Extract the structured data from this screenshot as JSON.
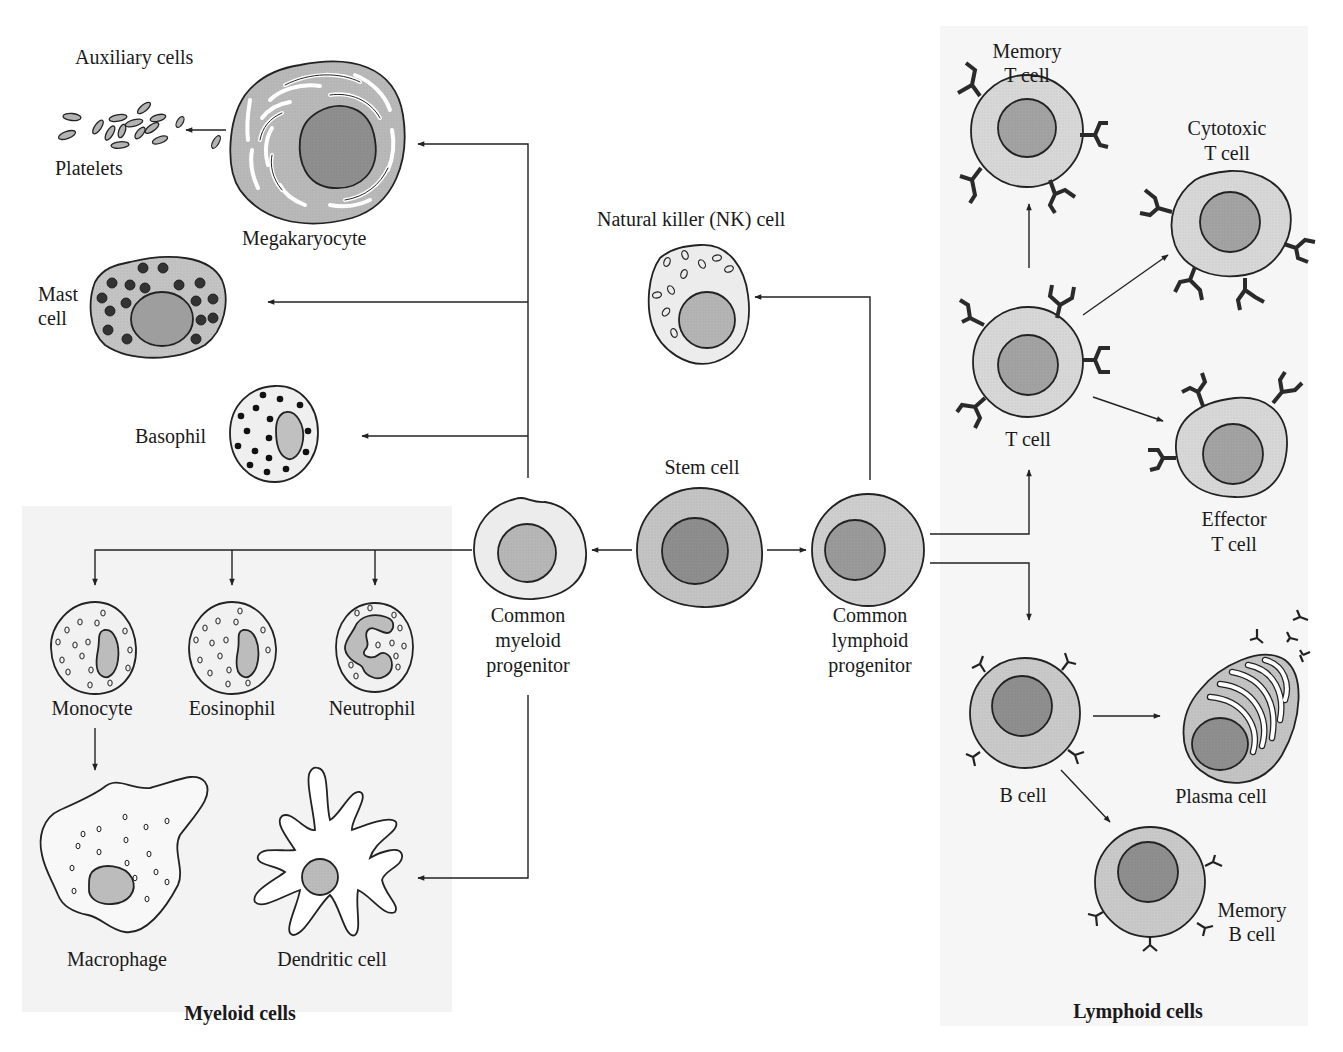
{
  "diagram": {
    "panels": {
      "myeloid": {
        "title": "Myeloid cells",
        "background": "#f3f3f3"
      },
      "lymphoid": {
        "title": "Lymphoid cells",
        "background": "#f5f5f5"
      }
    },
    "colors": {
      "cytoplasm_light": "#eeeeee",
      "cytoplasm_mid": "#d3d3d3",
      "cytoplasm_dark": "#b9b9b9",
      "nucleus_light": "#bdbdbd",
      "nucleus_dark": "#8f8f8f",
      "granule_dark": "#333333",
      "line": "#222222"
    },
    "labels": {
      "auxiliary": "Auxiliary cells",
      "platelets": "Platelets",
      "megakaryocyte": "Megakaryocyte",
      "mast_line1": "Mast",
      "mast_line2": "cell",
      "basophil": "Basophil",
      "nk": "Natural killer (NK) cell",
      "stem": "Stem cell",
      "cmp_line1": "Common",
      "cmp_line2": "myeloid",
      "cmp_line3": "progenitor",
      "clp_line1": "Common",
      "clp_line2": "lymphoid",
      "clp_line3": "progenitor",
      "monocyte": "Monocyte",
      "eosinophil": "Eosinophil",
      "neutrophil": "Neutrophil",
      "macrophage": "Macrophage",
      "dendritic": "Dendritic cell",
      "memory_t_line1": "Memory",
      "memory_t_line2": "T cell",
      "cytotoxic_line1": "Cytotoxic",
      "cytotoxic_line2": "T cell",
      "t_cell": "T cell",
      "effector_line1": "Effector",
      "effector_line2": "T cell",
      "b_cell": "B cell",
      "plasma": "Plasma cell",
      "memory_b_line1": "Memory",
      "memory_b_line2": "B cell"
    },
    "lineage": [
      {
        "from": "Stem cell",
        "to": "Common myeloid progenitor"
      },
      {
        "from": "Stem cell",
        "to": "Common lymphoid progenitor"
      },
      {
        "from": "Common myeloid progenitor",
        "to": "Megakaryocyte"
      },
      {
        "from": "Megakaryocyte",
        "to": "Platelets"
      },
      {
        "from": "Common myeloid progenitor",
        "to": "Mast cell"
      },
      {
        "from": "Common myeloid progenitor",
        "to": "Basophil"
      },
      {
        "from": "Common myeloid progenitor",
        "to": "Monocyte"
      },
      {
        "from": "Common myeloid progenitor",
        "to": "Eosinophil"
      },
      {
        "from": "Common myeloid progenitor",
        "to": "Neutrophil"
      },
      {
        "from": "Common myeloid progenitor",
        "to": "Dendritic cell"
      },
      {
        "from": "Monocyte",
        "to": "Macrophage"
      },
      {
        "from": "Common lymphoid progenitor",
        "to": "Natural killer (NK) cell"
      },
      {
        "from": "Common lymphoid progenitor",
        "to": "T cell"
      },
      {
        "from": "Common lymphoid progenitor",
        "to": "B cell"
      },
      {
        "from": "T cell",
        "to": "Memory T cell"
      },
      {
        "from": "T cell",
        "to": "Cytotoxic T cell"
      },
      {
        "from": "T cell",
        "to": "Effector T cell"
      },
      {
        "from": "B cell",
        "to": "Plasma cell"
      },
      {
        "from": "B cell",
        "to": "Memory B cell"
      }
    ]
  }
}
